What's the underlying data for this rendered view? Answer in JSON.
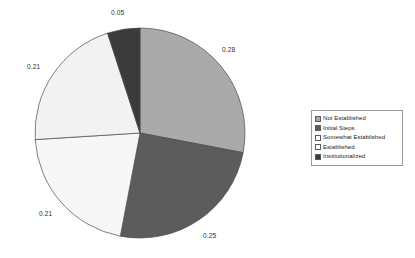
{
  "chart_data": {
    "type": "pie",
    "title": "",
    "xlabel": "",
    "ylabel": "",
    "legend_position": "right",
    "grid": false,
    "start_angle_deg": 0,
    "direction": "clockwise",
    "categories": [
      "Not Established",
      "Initial Steps",
      "Somewhat Established",
      "Established",
      "Institutionalized"
    ],
    "values": [
      0.28,
      0.25,
      0.21,
      0.21,
      0.05
    ],
    "data_labels": [
      "0.28",
      "0.25",
      "0.21",
      "0.21",
      "0.05"
    ],
    "colors": [
      "#aaaaaa",
      "#5c5c5c",
      "#f7f7f7",
      "#f2f2f2",
      "#3b3b3b"
    ]
  },
  "pie": {
    "center_x": 140,
    "center_y": 133,
    "radius": 105,
    "slices": [
      {
        "name": "Not Established",
        "value": 0.28,
        "label": "0.28",
        "color": "#aaaaaa",
        "label_x": 222,
        "label_y": 46
      },
      {
        "name": "Initial Steps",
        "value": 0.25,
        "label": "0.25",
        "color": "#5c5c5c",
        "label_x": 203,
        "label_y": 232
      },
      {
        "name": "Somewhat Established",
        "value": 0.21,
        "label": "0.21",
        "color": "#f7f7f7",
        "label_x": 39,
        "label_y": 210
      },
      {
        "name": "Established",
        "value": 0.21,
        "label": "0.21",
        "color": "#f2f2f2",
        "label_x": 27,
        "label_y": 63
      },
      {
        "name": "Institutionalized",
        "value": 0.05,
        "label": "0.05",
        "color": "#3b3b3b",
        "label_x": 111,
        "label_y": 9
      }
    ]
  },
  "legend": {
    "items": [
      {
        "label": "Not Established",
        "color": "#aaaaaa"
      },
      {
        "label": "Initial Steps",
        "color": "#5c5c5c"
      },
      {
        "label": "Somewhat Established",
        "color": "#ffffff"
      },
      {
        "label": "Established",
        "color": "#ffffff"
      },
      {
        "label": "Institutionalized",
        "color": "#3b3b3b"
      }
    ]
  }
}
